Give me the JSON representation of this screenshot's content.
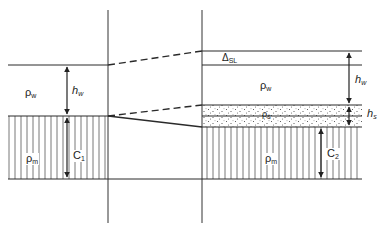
{
  "diagram": {
    "type": "isostasy-sediment-loading-cross-section",
    "panels": [
      {
        "name": "initial-state",
        "layers": [
          {
            "name": "water",
            "density_label": "ρ",
            "density_sub": "w",
            "thickness_label": "h",
            "thickness_sub": "w"
          },
          {
            "name": "mantle",
            "density_label": "ρ",
            "density_sub": "m",
            "thickness_label": "C",
            "thickness_sub": "1"
          }
        ]
      },
      {
        "name": "loaded-state",
        "sea_level_change_label": "Δ",
        "sea_level_change_sub": "SL",
        "layers": [
          {
            "name": "water",
            "density_label": "ρ",
            "density_sub": "w",
            "thickness_label": "h",
            "thickness_sub": "w"
          },
          {
            "name": "sediment",
            "density_label": "ρ",
            "density_sub": "s",
            "thickness_label": "h",
            "thickness_sub": "s"
          },
          {
            "name": "mantle",
            "density_label": "ρ",
            "density_sub": "m",
            "thickness_label": "C",
            "thickness_sub": "2"
          }
        ]
      }
    ],
    "colors": {
      "line": "#2a2a2a",
      "fill": "#ffffff",
      "hatch": "#555555",
      "stipple": "#444444"
    }
  }
}
